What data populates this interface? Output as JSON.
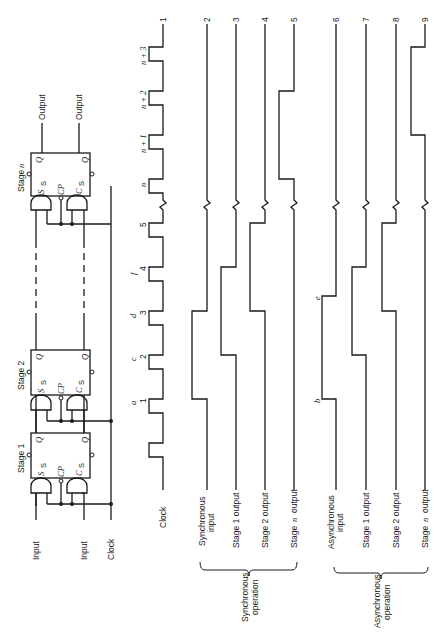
{
  "orientation": "rotated-90-ccw (text reads bottom-to-top)",
  "circuit": {
    "stages": [
      {
        "label": "Stage 1",
        "pins": {
          "set": "S",
          "set_sub": "S",
          "clock": "CP",
          "clear": "C",
          "clear_sub": "S",
          "q": "Q",
          "qbar": "Q̄"
        }
      },
      {
        "label": "Stage 2",
        "pins": {
          "set": "S",
          "set_sub": "S",
          "clock": "CP",
          "clear": "C",
          "clear_sub": "S",
          "q": "Q",
          "qbar": "Q̄"
        }
      },
      {
        "label": "Stage n",
        "stage_prefix": "Stage",
        "stage_var": "n",
        "pins": {
          "set": "S",
          "set_sub": "S",
          "clock": "CP",
          "clear": "C",
          "clear_sub": "S",
          "q": "Q",
          "qbar": "Q̄"
        }
      }
    ],
    "inputs": {
      "set_input": "Input",
      "clear_input": "Input",
      "clock": "Clock"
    },
    "outputs": {
      "q_output": "Output",
      "qbar_output": "Output"
    }
  },
  "timing": {
    "clock_label": "Clock",
    "clock_pulses": [
      "1",
      "2",
      "3",
      "4",
      "5",
      "n",
      "n + 1",
      "n + 2",
      "n + 3"
    ],
    "event_markers": {
      "a": "a",
      "b": "b",
      "c": "c",
      "d": "d",
      "e": "e",
      "f": "f"
    },
    "line_numbers": [
      "1",
      "2",
      "3",
      "4",
      "5",
      "6",
      "7",
      "8",
      "9"
    ],
    "signals": [
      {
        "id": 1,
        "label": "Clock"
      },
      {
        "id": 2,
        "label_line1": "Synchronous",
        "label_line2": "input"
      },
      {
        "id": 3,
        "label": "Stage  1  output"
      },
      {
        "id": 4,
        "label": "Stage  2  output"
      },
      {
        "id": 5,
        "label_prefix": "Stage",
        "label_var": "n",
        "label_suffix": "output"
      },
      {
        "id": 6,
        "label_line1": "Asynchronous",
        "label_line2": "input"
      },
      {
        "id": 7,
        "label": "Stage  1  output"
      },
      {
        "id": 8,
        "label": "Stage  2  output"
      },
      {
        "id": 9,
        "label_prefix": "Stage",
        "label_var": "n",
        "label_suffix": "output"
      }
    ],
    "groups": [
      {
        "label_line1": "Synchronous",
        "label_line2": "operation"
      },
      {
        "label_line1": "Asynchronous",
        "label_line2": "operation"
      }
    ]
  }
}
